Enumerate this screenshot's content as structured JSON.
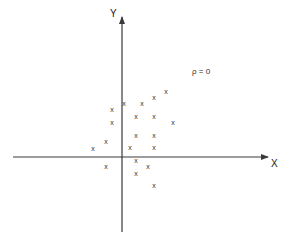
{
  "chart_data": {
    "type": "scatter",
    "title": "",
    "xlabel": "X",
    "ylabel": "Y",
    "annotation": "ρ = 0",
    "marker": "x",
    "grid": false,
    "legend": null,
    "axes": {
      "origin_px": [
        122,
        157
      ],
      "x_axis_px": {
        "start": 13,
        "end": 268
      },
      "y_axis_px": {
        "top": 17,
        "bottom": 232
      },
      "arrows": true,
      "ticks": false
    },
    "points_px": [
      {
        "x": 166,
        "y": 91
      },
      {
        "x": 154,
        "y": 97
      },
      {
        "x": 124,
        "y": 103
      },
      {
        "x": 142,
        "y": 103
      },
      {
        "x": 112,
        "y": 109
      },
      {
        "x": 136,
        "y": 116
      },
      {
        "x": 154,
        "y": 116
      },
      {
        "x": 112,
        "y": 122
      },
      {
        "x": 173,
        "y": 122
      },
      {
        "x": 136,
        "y": 135
      },
      {
        "x": 154,
        "y": 135
      },
      {
        "x": 106,
        "y": 141
      },
      {
        "x": 130,
        "y": 147
      },
      {
        "x": 154,
        "y": 147
      },
      {
        "x": 93,
        "y": 148
      },
      {
        "x": 136,
        "y": 160
      },
      {
        "x": 106,
        "y": 166
      },
      {
        "x": 148,
        "y": 166
      },
      {
        "x": 136,
        "y": 173
      },
      {
        "x": 154,
        "y": 185
      }
    ],
    "points": [
      {
        "x": 44,
        "y": 66
      },
      {
        "x": 32,
        "y": 60
      },
      {
        "x": 2,
        "y": 54
      },
      {
        "x": 20,
        "y": 54
      },
      {
        "x": -10,
        "y": 48
      },
      {
        "x": 14,
        "y": 41
      },
      {
        "x": 32,
        "y": 41
      },
      {
        "x": -10,
        "y": 35
      },
      {
        "x": 51,
        "y": 35
      },
      {
        "x": 14,
        "y": 22
      },
      {
        "x": 32,
        "y": 22
      },
      {
        "x": -16,
        "y": 16
      },
      {
        "x": 8,
        "y": 10
      },
      {
        "x": 32,
        "y": 10
      },
      {
        "x": -29,
        "y": 9
      },
      {
        "x": 14,
        "y": -3
      },
      {
        "x": -16,
        "y": -9
      },
      {
        "x": 26,
        "y": -9
      },
      {
        "x": 14,
        "y": -16
      },
      {
        "x": 32,
        "y": -28
      }
    ],
    "units_note": "points are pixel offsets from the axis origin (y positive upward); axes have no numeric ticks"
  },
  "labels": {
    "x_axis": "X",
    "y_axis": "Y",
    "rho": "ρ = 0",
    "marker_glyph": "x"
  },
  "colors": {
    "axis": "#3a3a3a",
    "marker": "#333333",
    "background": "#ffffff"
  }
}
